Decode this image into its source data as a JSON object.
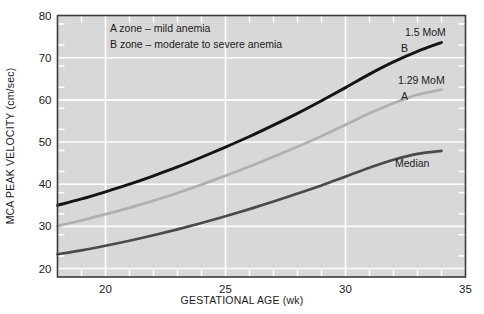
{
  "chart_data": {
    "type": "line",
    "title": "",
    "xlabel": "GESTATIONAL AGE (wk)",
    "ylabel": "MCA PEAK VELOCITY (cm/sec)",
    "xlim": [
      18,
      35
    ],
    "ylim": [
      18,
      80
    ],
    "x_ticks": [
      20,
      25,
      30,
      35
    ],
    "x_tick_labels": [
      "20",
      "25",
      "30",
      "35"
    ],
    "x_minor_tick_step": 1,
    "y_ticks": [
      20,
      30,
      40,
      50,
      60,
      70,
      80
    ],
    "y_tick_labels": [
      "20",
      "30",
      "40",
      "50",
      "60",
      "70",
      "80"
    ],
    "y_minor_tick_step": 5,
    "grid": true,
    "grid_color": "#ffffff",
    "plot_background": "#d8d8d8",
    "legend_position": "none",
    "annotations": [
      {
        "name": "a-zone-note",
        "text": "A zone – mild anemia"
      },
      {
        "name": "b-zone-note",
        "text": "B zone – moderate to severe anemia"
      }
    ],
    "x": [
      18,
      19,
      20,
      21,
      22,
      23,
      24,
      25,
      26,
      27,
      28,
      29,
      30,
      31,
      32,
      33,
      34
    ],
    "series": [
      {
        "name": "1.5 MoM",
        "label": "1.5 MoM",
        "short_label": "B",
        "color": "#141414",
        "width": 2.9,
        "values": [
          35.0,
          36.5,
          38.2,
          40.0,
          42.0,
          44.1,
          46.4,
          48.8,
          51.3,
          54.0,
          56.8,
          59.8,
          62.9,
          66.1,
          69.0,
          71.5,
          73.6
        ]
      },
      {
        "name": "1.29 MoM",
        "label": "1.29 MoM",
        "short_label": "A",
        "color": "#b0b0b0",
        "width": 2.7,
        "values": [
          30.1,
          31.4,
          32.9,
          34.4,
          36.1,
          37.9,
          39.9,
          42.0,
          44.2,
          46.5,
          48.9,
          51.4,
          54.1,
          56.8,
          59.2,
          61.2,
          62.4
        ]
      },
      {
        "name": "Median",
        "label": "Median",
        "short_label": "",
        "color": "#4a4a4a",
        "width": 2.7,
        "values": [
          23.4,
          24.3,
          25.4,
          26.6,
          27.9,
          29.3,
          30.8,
          32.4,
          34.1,
          35.9,
          37.8,
          39.7,
          41.8,
          43.9,
          45.8,
          47.2,
          47.9
        ]
      }
    ],
    "series_labels": [
      {
        "name": "b-curve-mom-label",
        "text": "1.5 MoM"
      },
      {
        "name": "b-curve-zone-label",
        "text": "B"
      },
      {
        "name": "a-curve-mom-label",
        "text": "1.29 MoM"
      },
      {
        "name": "a-curve-zone-label",
        "text": "A"
      },
      {
        "name": "median-curve-label",
        "text": "Median"
      }
    ]
  }
}
